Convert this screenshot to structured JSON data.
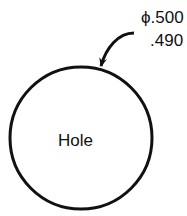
{
  "diagram": {
    "feature_label": "Hole",
    "dimension": {
      "symbol": "ϕ",
      "upper_limit": ".500",
      "lower_limit": ".490"
    },
    "colors": {
      "stroke": "#111111",
      "background": "#ffffff"
    }
  }
}
